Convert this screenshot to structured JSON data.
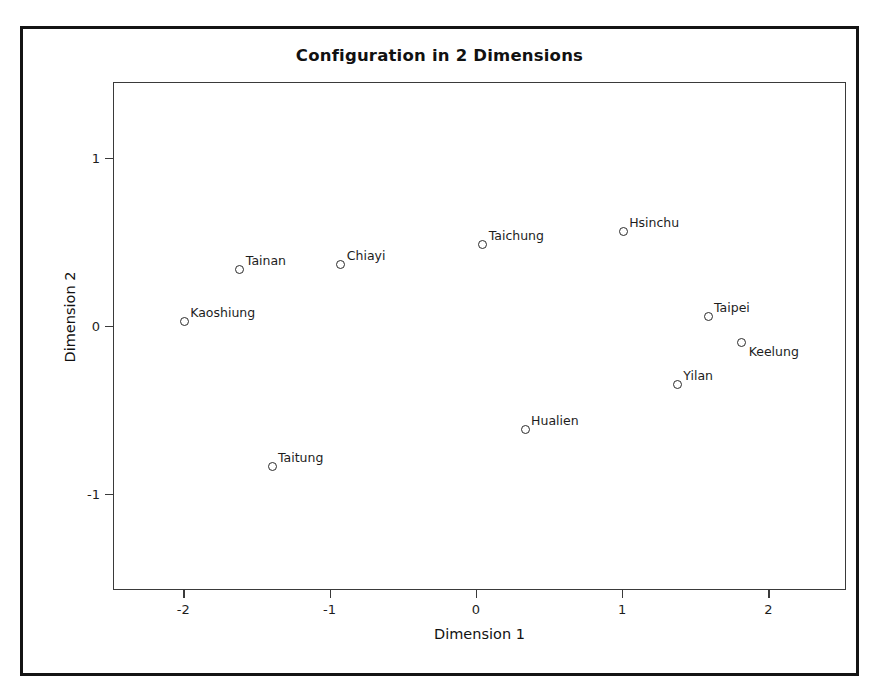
{
  "chart_data": {
    "type": "scatter",
    "title": "Configuration in 2 Dimensions",
    "xlabel": "Dimension 1",
    "ylabel": "Dimension 2",
    "xlim": [
      -2.48,
      2.53
    ],
    "ylim": [
      -1.57,
      1.45
    ],
    "xticks": [
      -2,
      -1,
      0,
      1,
      2
    ],
    "xticklabels": [
      "-2",
      "-1",
      "0",
      "1",
      "2"
    ],
    "yticks": [
      -1,
      0,
      1
    ],
    "yticklabels": [
      "-1",
      "0",
      "1"
    ],
    "grid": false,
    "legend": null,
    "marker": "open-circle",
    "points": [
      {
        "label": "Kaoshiung",
        "x": -2.0,
        "y": 0.03,
        "label_pos": "upper-right"
      },
      {
        "label": "Tainan",
        "x": -1.62,
        "y": 0.34,
        "label_pos": "upper-right"
      },
      {
        "label": "Taitung",
        "x": -1.4,
        "y": -0.83,
        "label_pos": "upper-right"
      },
      {
        "label": "Chiayi",
        "x": -0.93,
        "y": 0.37,
        "label_pos": "upper-right"
      },
      {
        "label": "Taichung",
        "x": 0.04,
        "y": 0.49,
        "label_pos": "upper-right"
      },
      {
        "label": "Hualien",
        "x": 0.33,
        "y": -0.61,
        "label_pos": "upper-right"
      },
      {
        "label": "Hsinchu",
        "x": 1.0,
        "y": 0.57,
        "label_pos": "upper-right"
      },
      {
        "label": "Taipei",
        "x": 1.58,
        "y": 0.06,
        "label_pos": "upper-right"
      },
      {
        "label": "Keelung",
        "x": 1.81,
        "y": -0.09,
        "label_pos": "lower-right"
      },
      {
        "label": "Yilan",
        "x": 1.37,
        "y": -0.34,
        "label_pos": "upper-right"
      }
    ]
  },
  "colors": {
    "frame": "#141414",
    "panel_border": "#3a3a3a",
    "marker": "#2b2b2b",
    "text": "#1d1d1d",
    "background": "#ffffff"
  }
}
